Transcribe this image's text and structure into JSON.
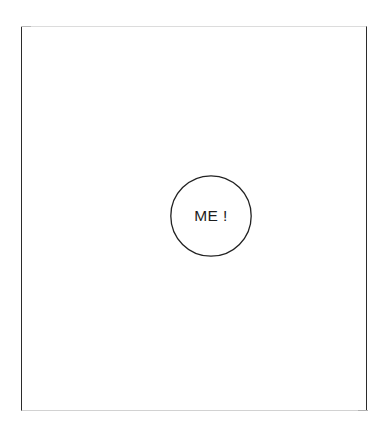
{
  "canvas": {
    "width": 390,
    "height": 434,
    "background_color": "#ffffff"
  },
  "frame": {
    "name": "outer-border-rectangle",
    "left": 21,
    "top": 26,
    "width": 346,
    "height": 385,
    "side_border_color": "#2b2b2b",
    "top_border_color": "#dcdcdc",
    "bottom_border_color": "#d2d2d2",
    "fill_color": "#ffffff"
  },
  "diagram": {
    "type": "node-diagram",
    "nodes": [
      {
        "id": "me",
        "shape": "circle",
        "label": "ME !",
        "center_x": 189,
        "center_y": 189,
        "diameter": 81,
        "stroke_color": "#222222",
        "stroke_width": 1.3,
        "fill_color": "#ffffff",
        "label_color": "#1c1c1c",
        "label_font_size": 15.5
      }
    ],
    "edges": []
  }
}
